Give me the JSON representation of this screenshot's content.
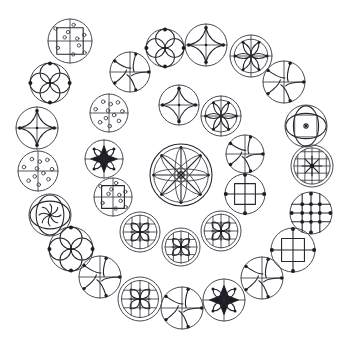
{
  "image": {
    "title": "Circular Glyph Arrangement",
    "width": 345,
    "height": 343,
    "background_color": "#ffffff",
    "ink_color": "#26262e",
    "outline_color": "#4a4a52",
    "description": "Spiral arrangement of 31 circular geometric glyphs around a large central eight-spoke wheel",
    "glyph_count": "31"
  },
  "palette": {
    "background": "#ffffff",
    "ink": "#26262e",
    "outline": "#4a4a52",
    "thin": "#3a3a44",
    "node": "#1c1c24"
  },
  "legend": {
    "types": [
      {
        "key": "wheel8",
        "label": "eight-spoke wheel with petals"
      },
      {
        "key": "quatrefoil",
        "label": "four-petal quatrefoil with nodes"
      },
      {
        "key": "pinwheel",
        "label": "curved-blade pinwheel"
      },
      {
        "key": "swirl-cross",
        "label": "swirl over cross axes"
      },
      {
        "key": "rosette",
        "label": "six-petal rosette on cross"
      },
      {
        "key": "dot-square",
        "label": "square with scattered dots"
      },
      {
        "key": "dot-scatter",
        "label": "cross with scattered dots"
      },
      {
        "key": "vesica-dot",
        "label": "vesica ellipses with centre dot"
      },
      {
        "key": "grid-star",
        "label": "dense grid with star"
      },
      {
        "key": "grid-nodes",
        "label": "grid with node intersections"
      },
      {
        "key": "square-nodes",
        "label": "square on cross with nodes"
      },
      {
        "key": "star-ellipse",
        "label": "star with ellipse overlay"
      },
      {
        "key": "dense-floret",
        "label": "dense floret over grid"
      },
      {
        "key": "starburst",
        "label": "bold starburst on cross"
      }
    ]
  },
  "glyphs": [
    {
      "id": "g01",
      "type": "dot-square",
      "cx": 70,
      "cy": 41,
      "r": 22
    },
    {
      "id": "g02",
      "type": "quatrefoil",
      "cx": 50,
      "cy": 83,
      "r": 20
    },
    {
      "id": "g03",
      "type": "swirl-cross",
      "cx": 37,
      "cy": 128,
      "r": 21
    },
    {
      "id": "g04",
      "type": "dot-scatter",
      "cx": 38,
      "cy": 171,
      "r": 20
    },
    {
      "id": "g05",
      "type": "star-ellipse",
      "cx": 50,
      "cy": 215,
      "r": 21
    },
    {
      "id": "g06",
      "type": "quatrefoil",
      "cx": 71,
      "cy": 249,
      "r": 22
    },
    {
      "id": "g07",
      "type": "pinwheel",
      "cx": 100,
      "cy": 277,
      "r": 21
    },
    {
      "id": "g08",
      "type": "dense-floret",
      "cx": 140,
      "cy": 299,
      "r": 22
    },
    {
      "id": "g09",
      "type": "pinwheel",
      "cx": 182,
      "cy": 308,
      "r": 21
    },
    {
      "id": "g10",
      "type": "starburst",
      "cx": 224,
      "cy": 300,
      "r": 21
    },
    {
      "id": "g11",
      "type": "pinwheel",
      "cx": 262,
      "cy": 278,
      "r": 21
    },
    {
      "id": "g12",
      "type": "square-nodes",
      "cx": 293,
      "cy": 250,
      "r": 22
    },
    {
      "id": "g13",
      "type": "grid-nodes",
      "cx": 311,
      "cy": 213,
      "r": 21
    },
    {
      "id": "g14",
      "type": "grid-star",
      "cx": 312,
      "cy": 166,
      "r": 21
    },
    {
      "id": "g15",
      "type": "vesica-dot",
      "cx": 306,
      "cy": 126,
      "r": 21
    },
    {
      "id": "g16",
      "type": "pinwheel",
      "cx": 284,
      "cy": 82,
      "r": 21
    },
    {
      "id": "g17",
      "type": "rosette",
      "cx": 251,
      "cy": 56,
      "r": 21
    },
    {
      "id": "g18",
      "type": "swirl-cross",
      "cx": 206,
      "cy": 45,
      "r": 21
    },
    {
      "id": "g19",
      "type": "quatrefoil",
      "cx": 165,
      "cy": 48,
      "r": 19
    },
    {
      "id": "g20",
      "type": "pinwheel",
      "cx": 130,
      "cy": 72,
      "r": 20
    },
    {
      "id": "g21",
      "type": "dot-scatter",
      "cx": 109,
      "cy": 113,
      "r": 19
    },
    {
      "id": "g22",
      "type": "starburst",
      "cx": 104,
      "cy": 159,
      "r": 19
    },
    {
      "id": "g23",
      "type": "dot-square",
      "cx": 113,
      "cy": 197,
      "r": 19
    },
    {
      "id": "g24",
      "type": "dense-floret",
      "cx": 140,
      "cy": 232,
      "r": 20
    },
    {
      "id": "g25",
      "type": "dense-floret",
      "cx": 181,
      "cy": 247,
      "r": 19
    },
    {
      "id": "g26",
      "type": "dense-floret",
      "cx": 221,
      "cy": 231,
      "r": 20
    },
    {
      "id": "g27",
      "type": "square-nodes",
      "cx": 245,
      "cy": 194,
      "r": 20
    },
    {
      "id": "g28",
      "type": "pinwheel",
      "cx": 245,
      "cy": 154,
      "r": 19
    },
    {
      "id": "g29",
      "type": "rosette",
      "cx": 221,
      "cy": 116,
      "r": 20
    },
    {
      "id": "g30",
      "type": "swirl-cross",
      "cx": 179,
      "cy": 105,
      "r": 20
    },
    {
      "id": "g31",
      "type": "wheel8",
      "cx": 181,
      "cy": 175,
      "r": 31
    }
  ]
}
